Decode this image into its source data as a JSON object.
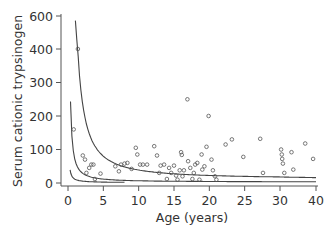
{
  "chart_data": {
    "type": "scatter",
    "title": "",
    "xlabel": "Age (years)",
    "ylabel": "Serum cationic trypsinogen",
    "x_ticks": [
      0,
      5,
      10,
      15,
      20,
      25,
      30,
      40
    ],
    "y_ticks": [
      0,
      100,
      200,
      300,
      400,
      600
    ],
    "xlim": [
      0,
      40
    ],
    "ylim": [
      0,
      600
    ],
    "axis_notes": "Both axes are compressed at the upper end: y 400-600 spans one tick interval; x 30-40 spans one tick interval.",
    "grid": false,
    "legend": null,
    "colors": {
      "axis": "#555555",
      "text": "#333333",
      "points": "#555555",
      "curves": "#444444"
    },
    "points": [
      {
        "x": 0.8,
        "y": 160
      },
      {
        "x": 1.4,
        "y": 400
      },
      {
        "x": 2.1,
        "y": 82
      },
      {
        "x": 2.4,
        "y": 70
      },
      {
        "x": 2.6,
        "y": 30
      },
      {
        "x": 3.0,
        "y": 45
      },
      {
        "x": 3.3,
        "y": 55
      },
      {
        "x": 3.6,
        "y": 55
      },
      {
        "x": 3.8,
        "y": 12
      },
      {
        "x": 4.6,
        "y": 28
      },
      {
        "x": 6.7,
        "y": 50
      },
      {
        "x": 7.2,
        "y": 35
      },
      {
        "x": 7.5,
        "y": 55
      },
      {
        "x": 8.0,
        "y": 58
      },
      {
        "x": 8.4,
        "y": 60
      },
      {
        "x": 9.0,
        "y": 42
      },
      {
        "x": 9.6,
        "y": 105
      },
      {
        "x": 9.8,
        "y": 85
      },
      {
        "x": 10.2,
        "y": 55
      },
      {
        "x": 10.6,
        "y": 55
      },
      {
        "x": 11.2,
        "y": 55
      },
      {
        "x": 12.2,
        "y": 110
      },
      {
        "x": 12.6,
        "y": 82
      },
      {
        "x": 12.9,
        "y": 30
      },
      {
        "x": 13.1,
        "y": 52
      },
      {
        "x": 13.6,
        "y": 55
      },
      {
        "x": 14.0,
        "y": 12
      },
      {
        "x": 14.3,
        "y": 45
      },
      {
        "x": 14.6,
        "y": 30
      },
      {
        "x": 15.0,
        "y": 52
      },
      {
        "x": 15.3,
        "y": 22
      },
      {
        "x": 15.5,
        "y": 10
      },
      {
        "x": 15.8,
        "y": 38
      },
      {
        "x": 16.0,
        "y": 92
      },
      {
        "x": 16.1,
        "y": 84
      },
      {
        "x": 16.2,
        "y": 20
      },
      {
        "x": 16.4,
        "y": 38
      },
      {
        "x": 16.9,
        "y": 250
      },
      {
        "x": 17.0,
        "y": 65
      },
      {
        "x": 17.3,
        "y": 45
      },
      {
        "x": 17.6,
        "y": 12
      },
      {
        "x": 17.8,
        "y": 30
      },
      {
        "x": 18.0,
        "y": 55
      },
      {
        "x": 18.3,
        "y": 60
      },
      {
        "x": 18.6,
        "y": 10
      },
      {
        "x": 18.9,
        "y": 85
      },
      {
        "x": 19.0,
        "y": 40
      },
      {
        "x": 19.3,
        "y": 50
      },
      {
        "x": 19.6,
        "y": 108
      },
      {
        "x": 19.9,
        "y": 200
      },
      {
        "x": 20.3,
        "y": 70
      },
      {
        "x": 20.5,
        "y": 38
      },
      {
        "x": 20.8,
        "y": 20
      },
      {
        "x": 21.0,
        "y": 10
      },
      {
        "x": 22.3,
        "y": 115
      },
      {
        "x": 23.2,
        "y": 130
      },
      {
        "x": 24.8,
        "y": 78
      },
      {
        "x": 27.2,
        "y": 132
      },
      {
        "x": 27.6,
        "y": 30
      },
      {
        "x": 30.3,
        "y": 100
      },
      {
        "x": 30.5,
        "y": 85
      },
      {
        "x": 30.6,
        "y": 72
      },
      {
        "x": 30.8,
        "y": 58
      },
      {
        "x": 31.2,
        "y": 30
      },
      {
        "x": 33.2,
        "y": 92
      },
      {
        "x": 33.7,
        "y": 40
      },
      {
        "x": 37.0,
        "y": 118
      },
      {
        "x": 39.2,
        "y": 72
      }
    ],
    "curves": [
      {
        "name": "upper-curve",
        "description": "steep decay from ~590 near age 1 toward ~15 by age 40"
      },
      {
        "name": "middle-curve",
        "description": "decay from ~250 near age 0.3 toward ~5 by age 40"
      },
      {
        "name": "lower-curve",
        "description": "short decay from ~40 near age 0.3 to ~2 by age 8"
      }
    ]
  }
}
